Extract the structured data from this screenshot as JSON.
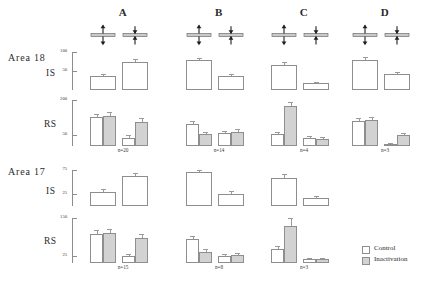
{
  "figure": {
    "area_labels": [
      {
        "text": "Area 18",
        "x": 8,
        "y": 52
      },
      {
        "text": "Area 17",
        "x": 8,
        "y": 166
      }
    ],
    "row_labels": [
      {
        "text": "IS",
        "x": 46,
        "y": 68
      },
      {
        "text": "RS",
        "x": 44,
        "y": 119
      },
      {
        "text": "IS",
        "x": 46,
        "y": 186
      },
      {
        "text": "RS",
        "x": 44,
        "y": 236
      }
    ],
    "columns": [
      {
        "label": "A",
        "x": 88
      },
      {
        "label": "B",
        "x": 184
      },
      {
        "label": "C",
        "x": 269
      },
      {
        "label": "D",
        "x": 350
      }
    ],
    "icon_names": [
      "bidirectional-arrows-bar-icon",
      "converging-arrows-bar-icon"
    ],
    "legend": {
      "entries": [
        {
          "label": "Control",
          "color": "#ffffff",
          "swatch": "control"
        },
        {
          "label": "Inactivation",
          "color": "#d2d2d2",
          "swatch": "inact"
        }
      ]
    },
    "n_labels": [
      {
        "text": "n=20",
        "x": 88,
        "y": 147
      },
      {
        "text": "n=14",
        "x": 184,
        "y": 147
      },
      {
        "text": "n=4",
        "x": 269,
        "y": 147
      },
      {
        "text": "n=3",
        "x": 350,
        "y": 147
      },
      {
        "text": "n=15",
        "x": 88,
        "y": 264
      },
      {
        "text": "n=8",
        "x": 184,
        "y": 264
      },
      {
        "text": "n=3",
        "x": 269,
        "y": 264
      }
    ]
  },
  "chart_data": {
    "type": "bar",
    "title": "",
    "xlabel": "",
    "ylabel": "",
    "grid": false,
    "legend_position": "bottom-right",
    "series": [
      {
        "name": "Control",
        "color": "#ffffff"
      },
      {
        "name": "Inactivation",
        "color": "#d2d2d2"
      }
    ],
    "stimulus_conditions": [
      "bidirectional",
      "converging"
    ],
    "panels": [
      {
        "area": "Area 18",
        "row": "IS",
        "ylim": [
          0,
          100
        ],
        "yticks": [
          50,
          100
        ],
        "ytick_labels": [
          "50",
          "100"
        ],
        "columns": [
          {
            "label": "A",
            "n": 20,
            "groups": [
              {
                "condition": "bidirectional",
                "bars": [
                  {
                    "series": "Control",
                    "value": 36,
                    "err": 6
                  }
                ]
              },
              {
                "condition": "converging",
                "bars": [
                  {
                    "series": "Control",
                    "value": 74,
                    "err": 8
                  }
                ]
              }
            ]
          },
          {
            "label": "B",
            "n": 14,
            "groups": [
              {
                "condition": "bidirectional",
                "bars": [
                  {
                    "series": "Control",
                    "value": 78,
                    "err": 5
                  }
                ]
              },
              {
                "condition": "converging",
                "bars": [
                  {
                    "series": "Control",
                    "value": 36,
                    "err": 5
                  }
                ]
              }
            ]
          },
          {
            "label": "C",
            "n": 4,
            "groups": [
              {
                "condition": "bidirectional",
                "bars": [
                  {
                    "series": "Control",
                    "value": 66,
                    "err": 9
                  }
                ]
              },
              {
                "condition": "converging",
                "bars": [
                  {
                    "series": "Control",
                    "value": 18,
                    "err": 4
                  }
                ]
              }
            ]
          },
          {
            "label": "D",
            "n": 3,
            "groups": [
              {
                "condition": "bidirectional",
                "bars": [
                  {
                    "series": "Control",
                    "value": 80,
                    "err": 6
                  }
                ]
              },
              {
                "condition": "converging",
                "bars": [
                  {
                    "series": "Control",
                    "value": 43,
                    "err": 5
                  }
                ]
              }
            ]
          }
        ]
      },
      {
        "area": "Area 18",
        "row": "RS",
        "ylim": [
          0,
          200
        ],
        "yticks": [
          50,
          200
        ],
        "ytick_labels": [
          "50",
          "200"
        ],
        "columns": [
          {
            "label": "A",
            "n": 20,
            "groups": [
              {
                "condition": "bidirectional",
                "bars": [
                  {
                    "series": "Control",
                    "value": 124,
                    "err": 16
                  },
                  {
                    "series": "Inactivation",
                    "value": 130,
                    "err": 16
                  }
                ]
              },
              {
                "condition": "converging",
                "bars": [
                  {
                    "series": "Control",
                    "value": 36,
                    "err": 12
                  },
                  {
                    "series": "Inactivation",
                    "value": 104,
                    "err": 18
                  }
                ]
              }
            ]
          },
          {
            "label": "B",
            "n": 14,
            "groups": [
              {
                "condition": "bidirectional",
                "bars": [
                  {
                    "series": "Control",
                    "value": 96,
                    "err": 14
                  },
                  {
                    "series": "Inactivation",
                    "value": 52,
                    "err": 10
                  }
                ]
              },
              {
                "condition": "converging",
                "bars": [
                  {
                    "series": "Control",
                    "value": 56,
                    "err": 10
                  },
                  {
                    "series": "Inactivation",
                    "value": 62,
                    "err": 11
                  }
                ]
              }
            ]
          },
          {
            "label": "C",
            "n": 4,
            "groups": [
              {
                "condition": "bidirectional",
                "bars": [
                  {
                    "series": "Control",
                    "value": 52,
                    "err": 11
                  },
                  {
                    "series": "Inactivation",
                    "value": 174,
                    "err": 16
                  }
                ]
              },
              {
                "condition": "converging",
                "bars": [
                  {
                    "series": "Control",
                    "value": 36,
                    "err": 9
                  },
                  {
                    "series": "Inactivation",
                    "value": 30,
                    "err": 8
                  }
                ]
              }
            ]
          },
          {
            "label": "D",
            "n": 3,
            "groups": [
              {
                "condition": "bidirectional",
                "bars": [
                  {
                    "series": "Control",
                    "value": 108,
                    "err": 13
                  },
                  {
                    "series": "Inactivation",
                    "value": 112,
                    "err": 13
                  }
                ]
              },
              {
                "condition": "converging",
                "bars": [
                  {
                    "series": "Control",
                    "value": 10,
                    "err": 4
                  },
                  {
                    "series": "Inactivation",
                    "value": 46,
                    "err": 9
                  }
                ]
              }
            ]
          }
        ]
      },
      {
        "area": "Area 17",
        "row": "IS",
        "ylim": [
          0,
          75
        ],
        "yticks": [
          25,
          75
        ],
        "ytick_labels": [
          "25",
          "75"
        ],
        "columns": [
          {
            "label": "A",
            "n": 15,
            "groups": [
              {
                "condition": "bidirectional",
                "bars": [
                  {
                    "series": "Control",
                    "value": 30,
                    "err": 5
                  }
                ]
              },
              {
                "condition": "converging",
                "bars": [
                  {
                    "series": "Control",
                    "value": 62,
                    "err": 7
                  }
                ]
              }
            ]
          },
          {
            "label": "B",
            "n": 8,
            "groups": [
              {
                "condition": "bidirectional",
                "bars": [
                  {
                    "series": "Control",
                    "value": 70,
                    "err": 6
                  }
                ]
              },
              {
                "condition": "converging",
                "bars": [
                  {
                    "series": "Control",
                    "value": 26,
                    "err": 5
                  }
                ]
              }
            ]
          },
          {
            "label": "C",
            "n": 3,
            "groups": [
              {
                "condition": "bidirectional",
                "bars": [
                  {
                    "series": "Control",
                    "value": 58,
                    "err": 9
                  }
                ]
              },
              {
                "condition": "converging",
                "bars": [
                  {
                    "series": "Control",
                    "value": 16,
                    "err": 4
                  }
                ]
              }
            ]
          }
        ]
      },
      {
        "area": "Area 17",
        "row": "RS",
        "ylim": [
          0,
          150
        ],
        "yticks": [
          25,
          150
        ],
        "ytick_labels": [
          "25",
          "150"
        ],
        "columns": [
          {
            "label": "A",
            "n": 15,
            "groups": [
              {
                "condition": "bidirectional",
                "bars": [
                  {
                    "series": "Control",
                    "value": 96,
                    "err": 14
                  },
                  {
                    "series": "Inactivation",
                    "value": 100,
                    "err": 14
                  }
                ]
              },
              {
                "condition": "converging",
                "bars": [
                  {
                    "series": "Control",
                    "value": 22,
                    "err": 9
                  },
                  {
                    "series": "Inactivation",
                    "value": 84,
                    "err": 14
                  }
                ]
              }
            ]
          },
          {
            "label": "B",
            "n": 8,
            "groups": [
              {
                "condition": "bidirectional",
                "bars": [
                  {
                    "series": "Control",
                    "value": 80,
                    "err": 11
                  },
                  {
                    "series": "Inactivation",
                    "value": 38,
                    "err": 8
                  }
                ]
              },
              {
                "condition": "converging",
                "bars": [
                  {
                    "series": "Control",
                    "value": 24,
                    "err": 6
                  },
                  {
                    "series": "Inactivation",
                    "value": 26,
                    "err": 7
                  }
                ]
              }
            ]
          },
          {
            "label": "C",
            "n": 3,
            "groups": [
              {
                "condition": "bidirectional",
                "bars": [
                  {
                    "series": "Control",
                    "value": 46,
                    "err": 12
                  },
                  {
                    "series": "Inactivation",
                    "value": 124,
                    "err": 26
                  }
                ]
              },
              {
                "condition": "converging",
                "bars": [
                  {
                    "series": "Control",
                    "value": 14,
                    "err": 4
                  },
                  {
                    "series": "Inactivation",
                    "value": 14,
                    "err": 4
                  }
                ]
              }
            ]
          }
        ]
      }
    ]
  }
}
